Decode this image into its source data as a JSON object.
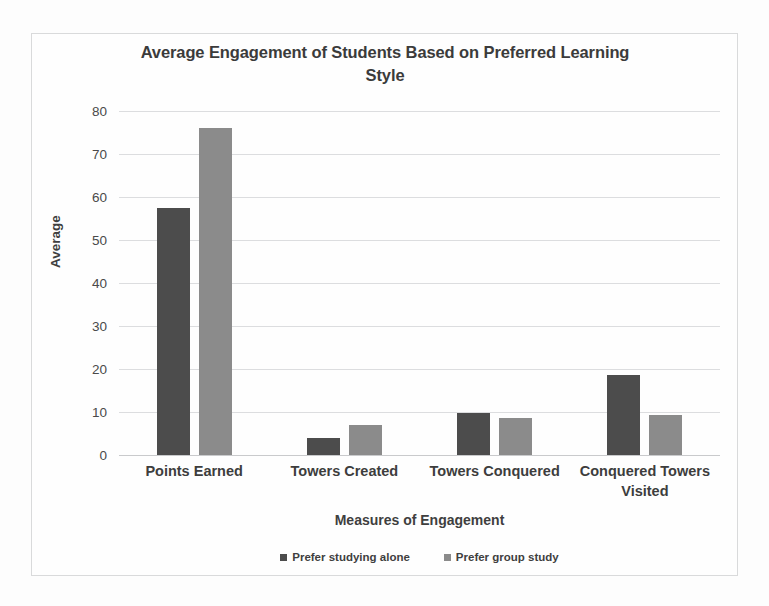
{
  "chart_data": {
    "type": "bar",
    "title": "Average Engagement of Students Based on Preferred Learning Style",
    "title_line1": "Average Engagement of Students Based on Preferred Learning",
    "title_line2": "Style",
    "xlabel": "Measures of Engagement",
    "ylabel": "Average",
    "ylim": [
      0,
      80
    ],
    "ytick_step": 10,
    "yticks": [
      "0",
      "10",
      "20",
      "30",
      "40",
      "50",
      "60",
      "70",
      "80"
    ],
    "grid": true,
    "legend_position": "bottom",
    "categories": [
      "Points Earned",
      "Towers Created",
      "Towers Conquered",
      "Conquered Towers Visited"
    ],
    "category_lines": [
      [
        "Points Earned"
      ],
      [
        "Towers Created"
      ],
      [
        "Towers Conquered"
      ],
      [
        "Conquered Towers",
        "Visited"
      ]
    ],
    "series": [
      {
        "name": "Prefer studying alone",
        "color": "#4c4c4c",
        "values": [
          57.5,
          4.0,
          9.8,
          18.5
        ]
      },
      {
        "name": "Prefer group study",
        "color": "#8b8b8b",
        "values": [
          76.0,
          7.0,
          8.6,
          9.4
        ]
      }
    ]
  },
  "colors": {
    "series_alone": "#4c4c4c",
    "series_group": "#8b8b8b",
    "gridline": "#dcdddf",
    "title_text": "#3b3b3b",
    "frame_border": "#d9dadb"
  }
}
